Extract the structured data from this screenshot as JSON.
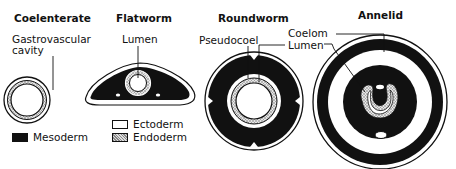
{
  "titles": {
    "coelenterate": "Coelenterate",
    "flatworm": "Flatworm",
    "roundworm": "Roundworm",
    "annelid": "Annelid"
  },
  "labels": {
    "gastrovascular_line1": "Gastrovascular",
    "gastrovascular_line2": "cavity",
    "flatworm_lumen": "Lumen",
    "pseudocoel": "Pseudocoel",
    "coelom": "Coelom",
    "lumen": "Lumen"
  },
  "legend": {
    "mesoderm": "Mesoderm",
    "ectoderm": "Ectoderm",
    "endoderm": "Endoderm"
  },
  "colors": {
    "mesoderm": "#111111",
    "ectoderm": "#ffffff",
    "endoderm": "#c8c8c8",
    "outline": "#111111"
  }
}
